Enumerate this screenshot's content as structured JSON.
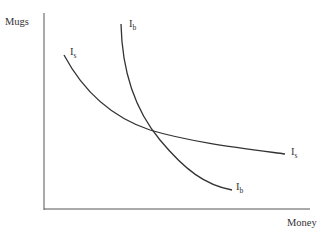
{
  "diagram": {
    "y_axis_label": "Mugs",
    "x_axis_label": "Money",
    "curves": [
      {
        "name": "Is",
        "main": "I",
        "sub": "s",
        "description": "seller indifference curve (flatter)"
      },
      {
        "name": "Ib",
        "main": "I",
        "sub": "b",
        "description": "buyer indifference curve (steeper)"
      }
    ],
    "labels": {
      "is_top_main": "I",
      "is_top_sub": "s",
      "is_right_main": "I",
      "is_right_sub": "s",
      "ib_top_main": "I",
      "ib_top_sub": "b",
      "ib_bottom_main": "I",
      "ib_bottom_sub": "b"
    },
    "colors": {
      "line": "#333333",
      "axis": "#444444"
    }
  }
}
